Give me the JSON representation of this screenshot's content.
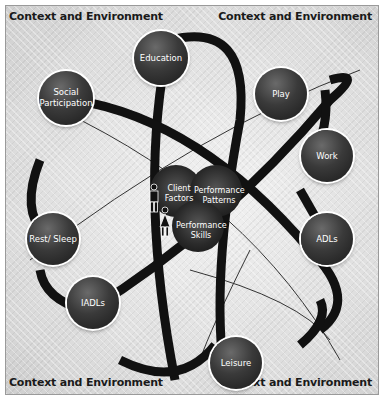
{
  "diagram": {
    "type": "atom-model",
    "corners": {
      "top_left": "Context and Environment",
      "top_right": "Context and Environment",
      "bottom_left": "Context and Environment",
      "bottom_right": "Context and Environment"
    },
    "occupations": [
      {
        "id": "education",
        "label": "Education"
      },
      {
        "id": "social",
        "label": "Social Participation"
      },
      {
        "id": "play",
        "label": "Play"
      },
      {
        "id": "work",
        "label": "Work"
      },
      {
        "id": "adls",
        "label": "ADLs"
      },
      {
        "id": "rest",
        "label": "Rest/ Sleep"
      },
      {
        "id": "iadls",
        "label": "IADLs"
      },
      {
        "id": "leisure",
        "label": "Leisure"
      }
    ],
    "core": {
      "client_factors": "Client Factors",
      "performance_patterns": "Performance Patterns",
      "performance_skills": "Performance Skills"
    },
    "colors": {
      "node": "#2a2a2a",
      "orbit": "#111111",
      "background": "#dcdcdc"
    }
  }
}
